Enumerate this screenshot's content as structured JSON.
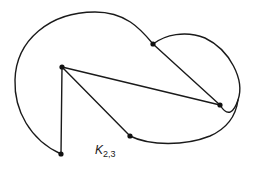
{
  "diagram": {
    "title": "K2,3",
    "label_main": "K",
    "label_sub": "2,3",
    "vertices": [
      {
        "id": "a",
        "x": 62,
        "y": 67
      },
      {
        "id": "b",
        "x": 153,
        "y": 44
      },
      {
        "id": "c",
        "x": 220,
        "y": 105
      },
      {
        "id": "d",
        "x": 130,
        "y": 136
      },
      {
        "id": "e",
        "x": 62,
        "y": 154
      }
    ],
    "edges": [
      {
        "from": "a",
        "to": "e",
        "type": "straight"
      },
      {
        "from": "a",
        "to": "d",
        "type": "straight"
      },
      {
        "from": "a",
        "to": "c",
        "type": "straight"
      },
      {
        "from": "b",
        "to": "c",
        "type": "straight"
      },
      {
        "from": "e",
        "to": "b",
        "type": "curved-outer"
      },
      {
        "from": "b",
        "to": "c",
        "type": "curved-right"
      },
      {
        "from": "d",
        "to": "c",
        "type": "curved-bottom"
      }
    ],
    "colors": {
      "stroke": "#1a1a1a",
      "background": "#ffffff"
    }
  }
}
